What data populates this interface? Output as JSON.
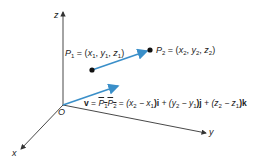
{
  "diagram": {
    "type": "3d-vector",
    "axes": {
      "z_label": "z",
      "y_label": "y",
      "x_label": "x",
      "origin_label": "O"
    },
    "points": {
      "p1": {
        "name": "P",
        "sub": "1",
        "coords": [
          "x",
          "1",
          "y",
          "1",
          "z",
          "1"
        ]
      },
      "p2": {
        "name": "P",
        "sub": "2",
        "coords": [
          "x",
          "2",
          "y",
          "2",
          "z",
          "2"
        ]
      }
    },
    "equation": {
      "vector": "v",
      "eq": "=",
      "p1": "P",
      "p1_sub": "1",
      "p2": "P",
      "p2_sub": "2",
      "term_x": "(x",
      "term_x_sub2": "2",
      "term_x_minus": " − x",
      "term_x_sub1": "1",
      "term_x_unit": ")i",
      "term_y": " + (y",
      "term_y_sub2": "2",
      "term_y_minus": " − y",
      "term_y_sub1": "1",
      "term_y_unit": ")j",
      "term_z": " + (z",
      "term_z_sub2": "2",
      "term_z_minus": " − z",
      "term_z_sub1": "1",
      "term_z_unit": ")k"
    },
    "colors": {
      "vector": "#3a8fc9",
      "axis": "#333333",
      "point": "#111111"
    }
  }
}
